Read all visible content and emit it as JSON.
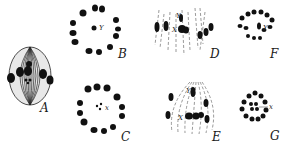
{
  "figure": {
    "ink_color": "#111111",
    "background": "#ffffff",
    "panels": [
      {
        "id": "A",
        "label": "A",
        "view": "side view spindle",
        "markers": [
          "Y",
          "x"
        ]
      },
      {
        "id": "B",
        "label": "B",
        "view": "polar view ring",
        "markers": [
          "Y"
        ]
      },
      {
        "id": "C",
        "label": "C",
        "view": "polar view ring",
        "markers": [
          "x"
        ]
      },
      {
        "id": "D",
        "label": "D",
        "view": "side view anaphase",
        "markers": [
          "Y",
          "X"
        ]
      },
      {
        "id": "E",
        "label": "E",
        "view": "side view spindle",
        "markers": [
          "Y",
          "X"
        ]
      },
      {
        "id": "F",
        "label": "F",
        "view": "polar view ring",
        "markers": [
          "Y"
        ]
      },
      {
        "id": "G",
        "label": "G",
        "view": "polar view ring",
        "markers": [
          "x"
        ]
      }
    ]
  },
  "labels": {
    "A": "A",
    "B": "B",
    "C": "C",
    "D": "D",
    "E": "E",
    "F": "F",
    "G": "G",
    "Y": "Y",
    "y": "Y",
    "x": "x",
    "X": "X"
  }
}
